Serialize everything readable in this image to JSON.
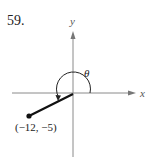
{
  "problem": {
    "number": "59."
  },
  "diagram": {
    "axes": {
      "x_label": "x",
      "y_label": "y"
    },
    "angle_label": "θ",
    "point": {
      "label": "(−12, −5)",
      "x": -12,
      "y": -5
    },
    "colors": {
      "axis": "#8a8a8a",
      "ray": "#111111",
      "arc": "#222222",
      "text": "#222222"
    }
  }
}
